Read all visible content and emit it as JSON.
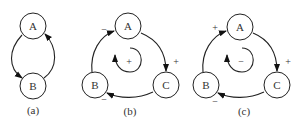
{
  "diagrams": [
    {
      "caption": "(a)",
      "nodes": [
        {
          "id": "A",
          "label": "A"
        },
        {
          "id": "B",
          "label": "B"
        }
      ]
    },
    {
      "caption": "(b)",
      "nodes": [
        {
          "id": "A",
          "label": "A"
        },
        {
          "id": "B",
          "label": "B"
        },
        {
          "id": "C",
          "label": "C"
        }
      ],
      "edge_signs": {
        "B_to_A": "−",
        "A_to_C": "+",
        "C_to_B": "−"
      },
      "loop_sign": "+"
    },
    {
      "caption": "(c)",
      "nodes": [
        {
          "id": "A",
          "label": "A"
        },
        {
          "id": "B",
          "label": "B"
        },
        {
          "id": "C",
          "label": "C"
        }
      ],
      "edge_signs": {
        "B_to_A": "+",
        "A_to_C": "+",
        "C_to_B": "−"
      },
      "loop_sign": "−"
    }
  ]
}
